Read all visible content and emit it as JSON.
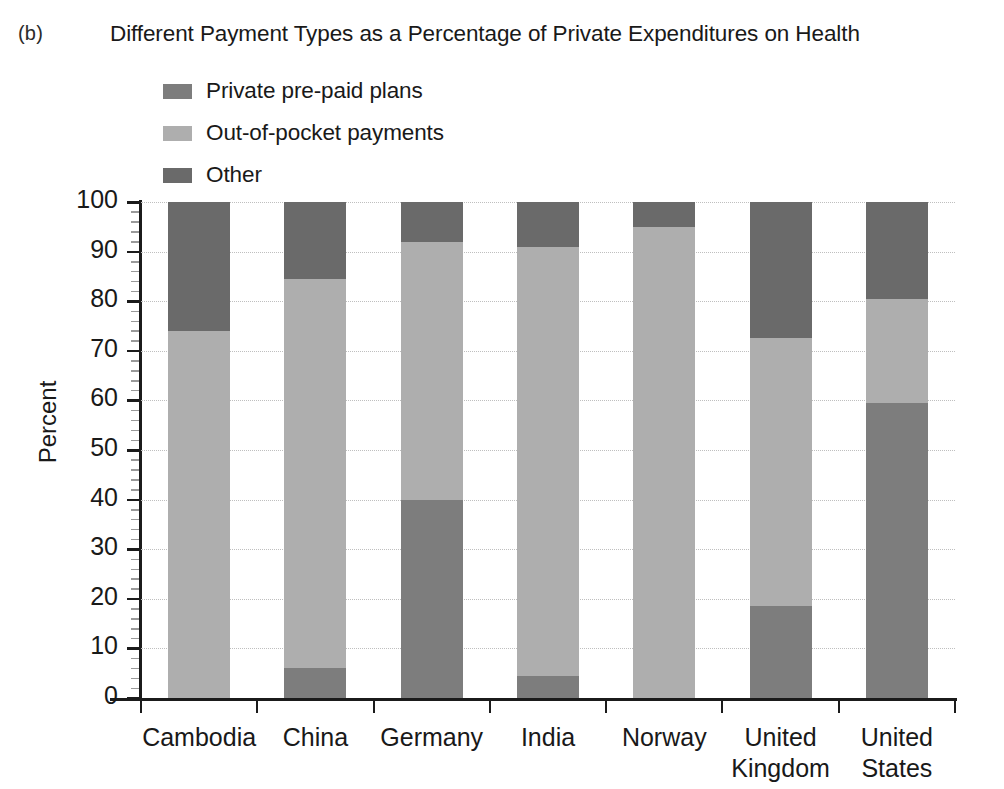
{
  "panel": {
    "label": "(b)"
  },
  "header": {
    "title": "Different Payment Types as a Percentage of Private Expenditures on Health"
  },
  "legend": {
    "position": "above-plot-left",
    "items": [
      {
        "label": "Private pre-paid plans",
        "color": "#7d7d7d",
        "icon": "square-swatch-icon"
      },
      {
        "label": "Out-of-pocket payments",
        "color": "#aeaeae",
        "icon": "square-swatch-icon"
      },
      {
        "label": "Other",
        "color": "#6a6a6a",
        "icon": "square-swatch-icon"
      }
    ]
  },
  "axes": {
    "ylabel": "Percent",
    "xlabel": "",
    "yticks": [
      "0",
      "10",
      "20",
      "30",
      "40",
      "50",
      "60",
      "70",
      "80",
      "90",
      "100"
    ],
    "ylim": [
      0,
      100
    ],
    "grid": "horizontal-dotted"
  },
  "chart_data": {
    "type": "bar",
    "subtype": "stacked-vertical-100pct",
    "title": "Different Payment Types as a Percentage of Private Expenditures on Health",
    "xlabel": "",
    "ylabel": "Percent",
    "ylim": [
      0,
      100
    ],
    "ytick_step": 10,
    "grid": true,
    "legend_position": "top-left-above-axes",
    "categories": [
      "Cambodia",
      "China",
      "Germany",
      "India",
      "Norway",
      "United Kingdom",
      "United States"
    ],
    "series": [
      {
        "name": "Private pre-paid plans",
        "color": "#7d7d7d",
        "values": [
          0,
          6,
          40,
          4.5,
          0,
          18.5,
          59.5
        ]
      },
      {
        "name": "Out-of-pocket payments",
        "color": "#aeaeae",
        "values": [
          74,
          78.5,
          52,
          86.5,
          95,
          54,
          21
        ]
      },
      {
        "name": "Other",
        "color": "#6a6a6a",
        "values": [
          26,
          15.5,
          8,
          9,
          5,
          27.5,
          19.5
        ]
      }
    ],
    "cumulative_tops": {
      "Cambodia": [
        0,
        74,
        100
      ],
      "China": [
        6,
        84.5,
        100
      ],
      "Germany": [
        40,
        92,
        100
      ],
      "India": [
        4.5,
        91,
        100
      ],
      "Norway": [
        0,
        95,
        100
      ],
      "United Kingdom": [
        18.5,
        72.5,
        100
      ],
      "United States": [
        59.5,
        80.5,
        100
      ]
    }
  }
}
